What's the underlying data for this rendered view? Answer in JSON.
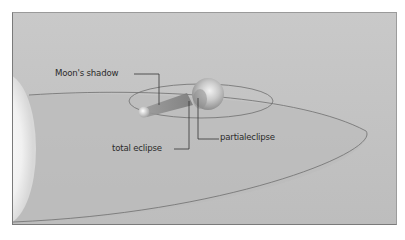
{
  "diagram": {
    "labels": {
      "moons_shadow": "Moon's shadow",
      "total_eclipse": "total eclipse",
      "partial_eclipse": "partialeclipse"
    },
    "colors": {
      "background": "#c6c6c6",
      "orbit_line": "#6e6e6e",
      "leader_line": "#333333",
      "text": "#2b2b2b",
      "sun": "#f4f4f4"
    }
  }
}
